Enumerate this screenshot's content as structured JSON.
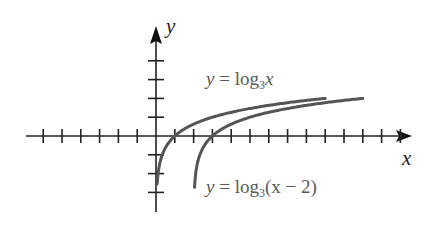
{
  "chart_data": {
    "type": "line",
    "title": "",
    "xlabel": "x",
    "ylabel": "y",
    "xlim": [
      -6,
      13
    ],
    "ylim": [
      -4,
      5
    ],
    "x_ticks": [
      -6,
      -5,
      -4,
      -3,
      -2,
      -1,
      1,
      2,
      3,
      4,
      5,
      6,
      7,
      8,
      9,
      10,
      11,
      12,
      13
    ],
    "y_ticks": [
      -3,
      -2,
      -1,
      1,
      2,
      3,
      4
    ],
    "grid": false,
    "series": [
      {
        "name": "y = log3 x",
        "function": "log3(x)",
        "x_range": [
          0.06,
          9
        ],
        "color": "#555555"
      },
      {
        "name": "y = log3(x − 2)",
        "function": "log3(x-2)",
        "x_range": [
          2.05,
          11
        ],
        "color": "#555555"
      }
    ],
    "annotations": [
      {
        "text": "y = log3x",
        "near": "upper curve"
      },
      {
        "text": "y = log3(x − 2)",
        "near": "lower curve"
      }
    ]
  },
  "labels": {
    "x_axis": "x",
    "y_axis": "y",
    "curve1": {
      "y": "y",
      "eq": " = log",
      "base": "3",
      "arg": "x"
    },
    "curve2": {
      "y": "y",
      "eq": " = log",
      "base": "3",
      "arg": "(x − 2)"
    }
  }
}
